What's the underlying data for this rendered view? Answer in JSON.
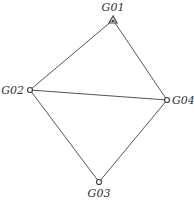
{
  "diagram": {
    "type": "network-graph",
    "nodes": [
      {
        "id": "G01",
        "label": "G01",
        "shape": "triangle"
      },
      {
        "id": "G02",
        "label": "G02",
        "shape": "circle"
      },
      {
        "id": "G03",
        "label": "G03",
        "shape": "circle"
      },
      {
        "id": "G04",
        "label": "G04",
        "shape": "circle"
      }
    ],
    "edges": [
      {
        "from": "G01",
        "to": "G02"
      },
      {
        "from": "G01",
        "to": "G04"
      },
      {
        "from": "G02",
        "to": "G04"
      },
      {
        "from": "G02",
        "to": "G03"
      },
      {
        "from": "G04",
        "to": "G03"
      }
    ],
    "colors": {
      "edge": "#555555",
      "node_stroke": "#444444",
      "text": "#333333"
    }
  }
}
